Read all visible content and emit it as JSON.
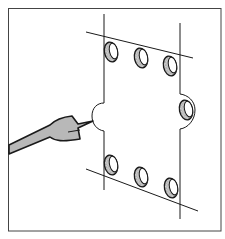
{
  "figure": {
    "frame": {
      "x": 8,
      "y": 8,
      "width": 213,
      "height": 223
    },
    "colors": {
      "line": "#1a1a1a",
      "fill_gray": "#b8b8b8",
      "hole_shading": "#9a9a9a",
      "background": "#ffffff"
    },
    "holes": [
      {
        "cx": 111,
        "cy": 51,
        "row": "top"
      },
      {
        "cx": 141,
        "cy": 58,
        "row": "top"
      },
      {
        "cx": 170,
        "cy": 65,
        "row": "top"
      },
      {
        "cx": 187,
        "cy": 109,
        "row": "side"
      },
      {
        "cx": 111,
        "cy": 164,
        "row": "bottom"
      },
      {
        "cx": 141,
        "cy": 176,
        "row": "bottom"
      },
      {
        "cx": 170,
        "cy": 187,
        "row": "bottom"
      }
    ]
  }
}
